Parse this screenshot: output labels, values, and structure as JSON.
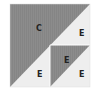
{
  "diagram": {
    "title": "",
    "colors": {
      "dark": "#8a8a8a",
      "light": "#eeeeee",
      "line": "#ffffff",
      "text": "#222222"
    },
    "regions": [
      {
        "id": "big-triangle",
        "label": "C"
      },
      {
        "id": "top-right-light",
        "label": "E"
      },
      {
        "id": "bottom-left-light",
        "label": "E"
      },
      {
        "id": "bottom-right-dark",
        "label": "E"
      },
      {
        "id": "bottom-right-light",
        "label": "E"
      }
    ]
  }
}
